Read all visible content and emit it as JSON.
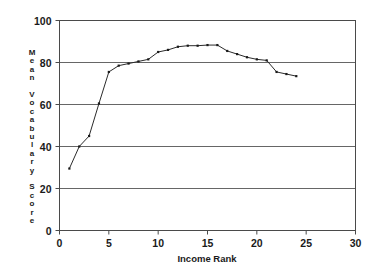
{
  "chart_data": {
    "type": "line",
    "title": "",
    "xlabel": "Income Rank",
    "ylabel": "Mean Vocabulary Score",
    "ylabel_chars": [
      "M",
      "e",
      "a",
      "n",
      "",
      "V",
      "o",
      "c",
      "a",
      "b",
      "u",
      "l",
      "a",
      "r",
      "y",
      "",
      "S",
      "c",
      "o",
      "r",
      "e"
    ],
    "xlim": [
      0,
      30
    ],
    "ylim": [
      0,
      100
    ],
    "xticks": [
      0,
      5,
      10,
      15,
      20,
      25,
      30
    ],
    "xtick_labels": [
      "0",
      "5",
      "10",
      "15",
      "20",
      "25",
      "30"
    ],
    "yticks": [
      0,
      20,
      40,
      60,
      80,
      100
    ],
    "ytick_labels": [
      "0",
      "20",
      "40",
      "60",
      "80",
      "100"
    ],
    "grid": "horizontal",
    "legend": "none",
    "marker": "square",
    "line_color": "#2b2b2b",
    "marker_color": "#1a1a1a",
    "grid_color": "#555555",
    "frame_color": "#4a4a4a",
    "background": "#ffffff",
    "x": [
      1,
      2,
      3,
      4,
      5,
      6,
      7,
      8,
      9,
      10,
      11,
      12,
      13,
      14,
      15,
      16,
      17,
      18,
      19,
      20,
      21,
      22,
      23,
      24
    ],
    "values": [
      29.5,
      40.0,
      45.0,
      60.5,
      75.5,
      78.5,
      79.5,
      80.5,
      81.5,
      85.0,
      86.0,
      87.5,
      88.0,
      88.0,
      88.3,
      88.3,
      85.5,
      84.0,
      82.5,
      81.5,
      81.0,
      75.5,
      74.5,
      73.5
    ],
    "series": [
      {
        "name": "Mean Vocabulary Score",
        "values": [
          29.5,
          40.0,
          45.0,
          60.5,
          75.5,
          78.5,
          79.5,
          80.5,
          81.5,
          85.0,
          86.0,
          87.5,
          88.0,
          88.0,
          88.3,
          88.3,
          85.5,
          84.0,
          82.5,
          81.5,
          81.0,
          75.5,
          74.5,
          73.5
        ]
      }
    ]
  }
}
